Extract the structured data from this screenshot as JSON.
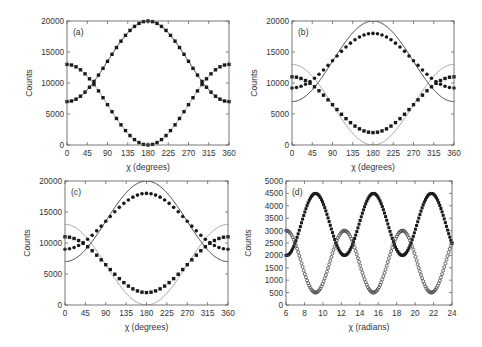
{
  "figure": {
    "panels": [
      "a",
      "b",
      "c",
      "d"
    ]
  },
  "chart_data": [
    {
      "id": "a",
      "type": "scatter",
      "panel_label": "(a)",
      "title": "",
      "xlabel": "χ (degrees)",
      "ylabel": "Counts",
      "xlim": [
        0,
        360
      ],
      "ylim": [
        0,
        20000
      ],
      "xticks": [
        0,
        45,
        90,
        135,
        180,
        225,
        270,
        315,
        360
      ],
      "yticks": [
        0,
        5000,
        10000,
        15000,
        20000
      ],
      "grid": false,
      "legend": null,
      "x_unit": "deg",
      "lines": [
        {
          "name": "theory-rising",
          "color": "#333333",
          "model": {
            "offset": 13500,
            "amp": -6500,
            "phase": 0,
            "period": 360
          }
        },
        {
          "name": "theory-falling",
          "color": "#999999",
          "model": {
            "offset": 6500,
            "amp": 6500,
            "phase": 0,
            "period": 360
          }
        }
      ],
      "series": [
        {
          "name": "data-rising",
          "marker": "square-filled",
          "step": 10,
          "x": [
            0,
            30,
            60,
            90,
            120,
            150,
            180,
            210,
            240,
            270,
            300,
            330,
            360
          ],
          "values": [
            7000,
            7900,
            10250,
            13500,
            16750,
            19130,
            20000,
            19130,
            16750,
            13500,
            10250,
            7900,
            7000
          ],
          "model": {
            "offset": 13500,
            "amp": -6500,
            "phase": 0,
            "period": 360
          }
        },
        {
          "name": "data-falling",
          "marker": "square-filled",
          "step": 10,
          "x": [
            0,
            30,
            60,
            90,
            120,
            150,
            180,
            210,
            240,
            270,
            300,
            330,
            360
          ],
          "values": [
            13000,
            12130,
            9750,
            6500,
            3250,
            870,
            0,
            870,
            3250,
            6500,
            9750,
            12130,
            13000
          ],
          "model": {
            "offset": 6500,
            "amp": 6500,
            "phase": 0,
            "period": 360
          }
        }
      ]
    },
    {
      "id": "b",
      "type": "scatter",
      "panel_label": "(b)",
      "title": "",
      "xlabel": "χ (degrees)",
      "ylabel": "Counts",
      "xlim": [
        0,
        360
      ],
      "ylim": [
        0,
        20000
      ],
      "xticks": [
        0,
        45,
        90,
        135,
        180,
        225,
        270,
        315,
        360
      ],
      "yticks": [
        0,
        5000,
        10000,
        15000,
        20000
      ],
      "grid": false,
      "legend": null,
      "x_unit": "deg",
      "lines": [
        {
          "name": "theory-rising",
          "color": "#333333",
          "model": {
            "offset": 13500,
            "amp": -6500,
            "phase": 0,
            "period": 360
          }
        },
        {
          "name": "theory-falling",
          "color": "#999999",
          "model": {
            "offset": 6500,
            "amp": 6500,
            "phase": 0,
            "period": 360
          }
        }
      ],
      "series": [
        {
          "name": "data-rising",
          "marker": "circle-filled",
          "step": 10,
          "x": [
            0,
            30,
            60,
            90,
            120,
            150,
            180,
            210,
            240,
            270,
            300,
            330,
            360
          ],
          "values": [
            9200,
            9840,
            11600,
            13600,
            15600,
            17360,
            18000,
            17360,
            15600,
            13600,
            11600,
            9840,
            9200
          ],
          "model": {
            "offset": 13600,
            "amp": -4400,
            "phase": 0,
            "period": 360
          }
        },
        {
          "name": "data-falling",
          "marker": "square-filled",
          "step": 10,
          "x": [
            0,
            30,
            60,
            90,
            120,
            150,
            180,
            210,
            240,
            270,
            300,
            330,
            360
          ],
          "values": [
            11000,
            10400,
            8750,
            6500,
            4250,
            2600,
            2000,
            2600,
            4250,
            6500,
            8750,
            10400,
            11000
          ],
          "model": {
            "offset": 6500,
            "amp": 4500,
            "phase": 0,
            "period": 360
          }
        }
      ]
    },
    {
      "id": "c",
      "type": "scatter",
      "panel_label": "(c)",
      "title": "",
      "xlabel": "χ (degrees)",
      "ylabel": "Counts",
      "xlim": [
        0,
        360
      ],
      "ylim": [
        0,
        20000
      ],
      "xticks": [
        0,
        45,
        90,
        135,
        180,
        225,
        270,
        315,
        360
      ],
      "yticks": [
        0,
        5000,
        10000,
        15000,
        20000
      ],
      "grid": false,
      "legend": null,
      "x_unit": "deg",
      "lines": [
        {
          "name": "theory-rising",
          "color": "#333333",
          "model": {
            "offset": 13500,
            "amp": -6500,
            "phase": 0,
            "period": 360
          }
        },
        {
          "name": "theory-falling",
          "color": "#999999",
          "model": {
            "offset": 6500,
            "amp": 6500,
            "phase": 0,
            "period": 360
          }
        }
      ],
      "series": [
        {
          "name": "data-rising",
          "marker": "circle-filled",
          "step": 10,
          "x": [
            0,
            30,
            60,
            90,
            120,
            150,
            180,
            210,
            240,
            270,
            300,
            330,
            360
          ],
          "values": [
            9000,
            9700,
            11500,
            13500,
            15500,
            17300,
            18000,
            17300,
            15500,
            13500,
            11500,
            9700,
            9000
          ],
          "model": {
            "offset": 13500,
            "amp": -4500,
            "phase": 0,
            "period": 360
          }
        },
        {
          "name": "data-falling",
          "marker": "square-filled",
          "step": 10,
          "x": [
            0,
            30,
            60,
            90,
            120,
            150,
            180,
            210,
            240,
            270,
            300,
            330,
            360
          ],
          "values": [
            11000,
            10400,
            8750,
            6500,
            4250,
            2600,
            2000,
            2600,
            4250,
            6500,
            8750,
            10400,
            11000
          ],
          "model": {
            "offset": 6500,
            "amp": 4500,
            "phase": 0,
            "period": 360
          }
        }
      ]
    },
    {
      "id": "d",
      "type": "scatter",
      "panel_label": "(d)",
      "title": "",
      "xlabel": "χ (radians)",
      "ylabel": "Counts",
      "xlim": [
        6,
        24
      ],
      "ylim": [
        0,
        5000
      ],
      "xticks": [
        6,
        8,
        10,
        12,
        14,
        16,
        18,
        20,
        22,
        24
      ],
      "yticks": [
        0,
        500,
        1000,
        1500,
        2000,
        2500,
        3000,
        3500,
        4000,
        4500,
        5000
      ],
      "grid": false,
      "legend": null,
      "x_unit": "rad",
      "lines": [],
      "series": [
        {
          "name": "data-upper",
          "marker": "square-filled",
          "step": 0.12,
          "x": [
            6,
            9.2,
            12.3,
            15.4,
            18.5,
            21.7,
            24
          ],
          "values": [
            2000,
            4500,
            2000,
            4500,
            2000,
            4500,
            2600
          ],
          "model": {
            "offset": 3250,
            "amp": 1250,
            "phase": 9.2,
            "period": 6.2832
          }
        },
        {
          "name": "data-lower",
          "marker": "circle-open",
          "step": 0.12,
          "x": [
            6,
            9.2,
            12.3,
            15.4,
            18.5,
            21.7,
            24
          ],
          "values": [
            3000,
            500,
            3000,
            500,
            3000,
            500,
            2400
          ],
          "model": {
            "offset": 1750,
            "amp": -1250,
            "phase": 9.2,
            "period": 6.2832
          }
        }
      ]
    }
  ],
  "layout": {
    "panels": [
      {
        "id": "a",
        "x0": 67,
        "x1": 229,
        "y0": 21,
        "y1": 145
      },
      {
        "id": "b",
        "x0": 292,
        "x1": 454,
        "y0": 21,
        "y1": 145
      },
      {
        "id": "c",
        "x0": 65,
        "x1": 228,
        "y0": 181,
        "y1": 305
      },
      {
        "id": "d",
        "x0": 286,
        "x1": 452,
        "y0": 181,
        "y1": 305
      }
    ]
  }
}
